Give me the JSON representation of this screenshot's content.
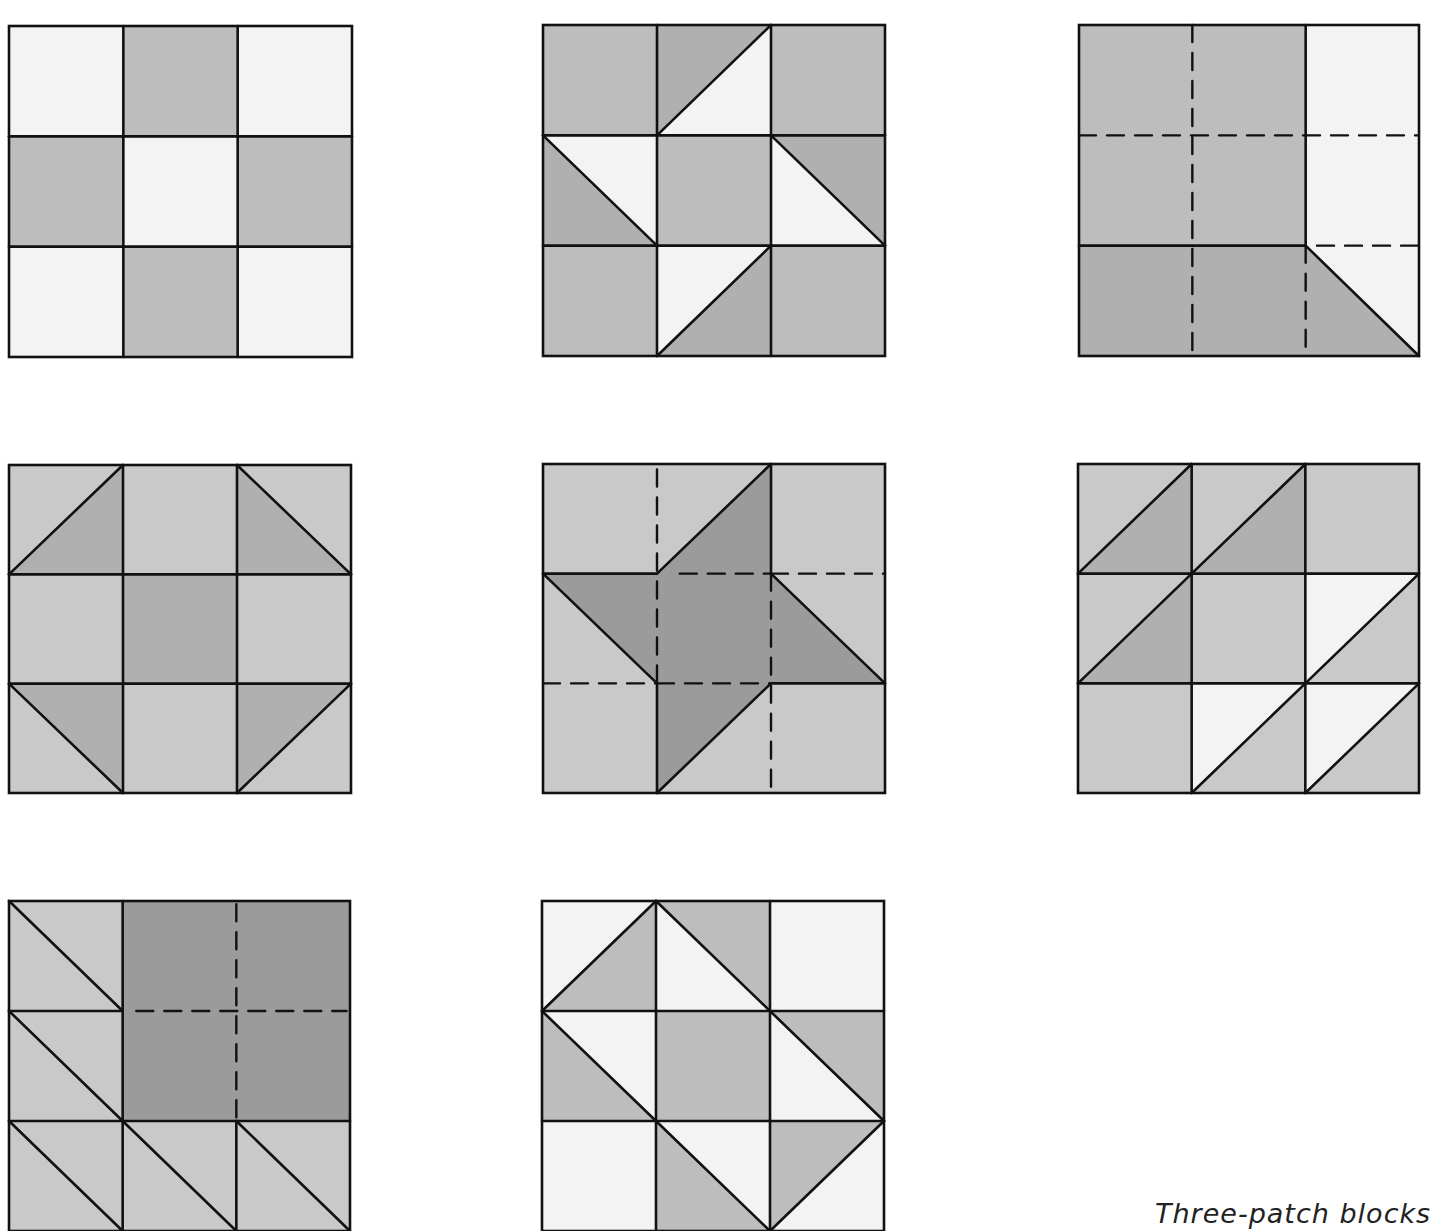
{
  "page": {
    "caption": "Three-patch blocks"
  },
  "colors": {
    "white": "#f3f3f3",
    "light": "#c9c9c9",
    "medium": "#bdbdbd",
    "mid_dark": "#b0b0b0",
    "dark": "#9b9b9b",
    "line": "#111111"
  },
  "blocks": [
    {
      "id": "block-1",
      "x": 9,
      "y": 26,
      "w": 343,
      "h": 331,
      "shapes": [
        {
          "t": "rect",
          "x": 0,
          "y": 0,
          "w": 1,
          "h": 1,
          "c": "white"
        },
        {
          "t": "rect",
          "x": 1,
          "y": 0,
          "w": 1,
          "h": 1,
          "c": "medium"
        },
        {
          "t": "rect",
          "x": 2,
          "y": 0,
          "w": 1,
          "h": 1,
          "c": "white"
        },
        {
          "t": "rect",
          "x": 0,
          "y": 1,
          "w": 1,
          "h": 1,
          "c": "medium"
        },
        {
          "t": "rect",
          "x": 1,
          "y": 1,
          "w": 1,
          "h": 1,
          "c": "white"
        },
        {
          "t": "rect",
          "x": 2,
          "y": 1,
          "w": 1,
          "h": 1,
          "c": "medium"
        },
        {
          "t": "rect",
          "x": 0,
          "y": 2,
          "w": 1,
          "h": 1,
          "c": "white"
        },
        {
          "t": "rect",
          "x": 1,
          "y": 2,
          "w": 1,
          "h": 1,
          "c": "medium"
        },
        {
          "t": "rect",
          "x": 2,
          "y": 2,
          "w": 1,
          "h": 1,
          "c": "white"
        }
      ],
      "lines": [
        [
          1,
          0,
          1,
          3
        ],
        [
          2,
          0,
          2,
          3
        ],
        [
          0,
          1,
          3,
          1
        ],
        [
          0,
          2,
          3,
          2
        ]
      ],
      "dashes": []
    },
    {
      "id": "block-2",
      "x": 543,
      "y": 25,
      "w": 342,
      "h": 331,
      "shapes": [
        {
          "t": "rect",
          "x": 0,
          "y": 0,
          "w": 3,
          "h": 3,
          "c": "medium"
        },
        {
          "t": "poly",
          "p": [
            [
              1,
              0
            ],
            [
              2,
              0
            ],
            [
              1,
              1
            ]
          ],
          "c": "mid_dark"
        },
        {
          "t": "poly",
          "p": [
            [
              2,
              0
            ],
            [
              2,
              1
            ],
            [
              1,
              1
            ]
          ],
          "c": "white"
        },
        {
          "t": "poly",
          "p": [
            [
              0,
              1
            ],
            [
              1,
              1
            ],
            [
              1,
              2
            ]
          ],
          "c": "white"
        },
        {
          "t": "poly",
          "p": [
            [
              0,
              1
            ],
            [
              1,
              2
            ],
            [
              0,
              2
            ]
          ],
          "c": "mid_dark"
        },
        {
          "t": "poly",
          "p": [
            [
              2,
              1
            ],
            [
              3,
              1
            ],
            [
              3,
              2
            ]
          ],
          "c": "mid_dark"
        },
        {
          "t": "poly",
          "p": [
            [
              2,
              1
            ],
            [
              3,
              2
            ],
            [
              2,
              2
            ]
          ],
          "c": "white"
        },
        {
          "t": "poly",
          "p": [
            [
              1,
              2
            ],
            [
              2,
              2
            ],
            [
              1,
              3
            ]
          ],
          "c": "white"
        },
        {
          "t": "poly",
          "p": [
            [
              2,
              2
            ],
            [
              2,
              3
            ],
            [
              1,
              3
            ]
          ],
          "c": "mid_dark"
        }
      ],
      "lines": [
        [
          1,
          0,
          1,
          3
        ],
        [
          2,
          0,
          2,
          3
        ],
        [
          0,
          1,
          3,
          1
        ],
        [
          0,
          2,
          3,
          2
        ],
        [
          1,
          1,
          2,
          0
        ],
        [
          0,
          1,
          1,
          2
        ],
        [
          2,
          1,
          3,
          2
        ],
        [
          1,
          3,
          2,
          2
        ]
      ],
      "dashes": []
    },
    {
      "id": "block-3",
      "x": 1079,
      "y": 25,
      "w": 340,
      "h": 331,
      "shapes": [
        {
          "t": "rect",
          "x": 0,
          "y": 0,
          "w": 2,
          "h": 2,
          "c": "medium"
        },
        {
          "t": "rect",
          "x": 2,
          "y": 0,
          "w": 1,
          "h": 3,
          "c": "white"
        },
        {
          "t": "poly",
          "p": [
            [
              0,
              2
            ],
            [
              2,
              2
            ],
            [
              3,
              3
            ],
            [
              0,
              3
            ]
          ],
          "c": "mid_dark"
        }
      ],
      "lines": [
        [
          2,
          0,
          2,
          2
        ],
        [
          0,
          2,
          2,
          2
        ],
        [
          2,
          2,
          3,
          3
        ]
      ],
      "dashes": [
        [
          1,
          0,
          1,
          3
        ],
        [
          0,
          1,
          3,
          1
        ],
        [
          2.1,
          2,
          3,
          2
        ],
        [
          2,
          2,
          2,
          3
        ]
      ]
    },
    {
      "id": "block-4",
      "x": 9,
      "y": 465,
      "w": 342,
      "h": 328,
      "shapes": [
        {
          "t": "rect",
          "x": 0,
          "y": 0,
          "w": 3,
          "h": 3,
          "c": "light"
        },
        {
          "t": "rect",
          "x": 1,
          "y": 1,
          "w": 1,
          "h": 1,
          "c": "mid_dark"
        },
        {
          "t": "poly",
          "p": [
            [
              0,
              1
            ],
            [
              1,
              0
            ],
            [
              1,
              1
            ]
          ],
          "c": "mid_dark"
        },
        {
          "t": "poly",
          "p": [
            [
              2,
              0
            ],
            [
              3,
              1
            ],
            [
              2,
              1
            ]
          ],
          "c": "mid_dark"
        },
        {
          "t": "poly",
          "p": [
            [
              0,
              2
            ],
            [
              1,
              2
            ],
            [
              1,
              3
            ]
          ],
          "c": "mid_dark"
        },
        {
          "t": "poly",
          "p": [
            [
              2,
              2
            ],
            [
              3,
              2
            ],
            [
              2,
              3
            ]
          ],
          "c": "mid_dark"
        }
      ],
      "lines": [
        [
          1,
          0,
          1,
          3
        ],
        [
          2,
          0,
          2,
          3
        ],
        [
          0,
          1,
          3,
          1
        ],
        [
          0,
          2,
          3,
          2
        ],
        [
          0,
          1,
          1,
          0
        ],
        [
          2,
          0,
          3,
          1
        ],
        [
          0,
          2,
          1,
          3
        ],
        [
          3,
          2,
          2,
          3
        ]
      ],
      "dashes": []
    },
    {
      "id": "block-5",
      "x": 543,
      "y": 464,
      "w": 342,
      "h": 329,
      "shapes": [
        {
          "t": "rect",
          "x": 0,
          "y": 0,
          "w": 3,
          "h": 3,
          "c": "light"
        },
        {
          "t": "poly",
          "p": [
            [
              1,
              1
            ],
            [
              2,
              0
            ],
            [
              2,
              1
            ],
            [
              3,
              2
            ],
            [
              2,
              2
            ],
            [
              1,
              3
            ],
            [
              1,
              2
            ],
            [
              0,
              1
            ]
          ],
          "c": "dark"
        }
      ],
      "lines": [
        [
          1,
          1,
          2,
          0
        ],
        [
          2,
          0,
          2,
          1
        ],
        [
          2,
          1,
          3,
          2
        ],
        [
          0,
          1,
          1,
          1
        ],
        [
          0,
          1,
          1,
          2
        ],
        [
          1,
          2,
          1,
          3
        ],
        [
          1,
          3,
          2,
          2
        ],
        [
          2,
          2,
          3,
          2
        ]
      ],
      "dashes": [
        [
          1,
          0.05,
          1,
          2
        ],
        [
          1.2,
          1,
          2,
          1
        ],
        [
          2,
          1,
          3,
          1
        ],
        [
          0,
          2,
          1,
          2
        ],
        [
          1,
          2,
          2,
          2
        ],
        [
          2,
          1,
          2,
          2.95
        ]
      ]
    },
    {
      "id": "block-6",
      "x": 1078,
      "y": 464,
      "w": 341,
      "h": 329,
      "shapes": [
        {
          "t": "rect",
          "x": 0,
          "y": 0,
          "w": 3,
          "h": 3,
          "c": "light"
        },
        {
          "t": "poly",
          "p": [
            [
              0,
              1
            ],
            [
              1,
              0
            ],
            [
              1,
              1
            ]
          ],
          "c": "mid_dark"
        },
        {
          "t": "poly",
          "p": [
            [
              1,
              1
            ],
            [
              2,
              0
            ],
            [
              2,
              1
            ]
          ],
          "c": "mid_dark"
        },
        {
          "t": "poly",
          "p": [
            [
              0,
              2
            ],
            [
              1,
              1
            ],
            [
              1,
              2
            ]
          ],
          "c": "mid_dark"
        },
        {
          "t": "poly",
          "p": [
            [
              2,
              1
            ],
            [
              3,
              1
            ],
            [
              2,
              2
            ]
          ],
          "c": "white"
        },
        {
          "t": "poly",
          "p": [
            [
              1,
              2
            ],
            [
              2,
              2
            ],
            [
              1,
              3
            ]
          ],
          "c": "white"
        },
        {
          "t": "poly",
          "p": [
            [
              2,
              2
            ],
            [
              3,
              2
            ],
            [
              2,
              3
            ]
          ],
          "c": "white"
        }
      ],
      "lines": [
        [
          1,
          0,
          1,
          3
        ],
        [
          2,
          0,
          2,
          3
        ],
        [
          0,
          1,
          3,
          1
        ],
        [
          0,
          2,
          3,
          2
        ],
        [
          0,
          1,
          1,
          0
        ],
        [
          1,
          1,
          2,
          0
        ],
        [
          0,
          2,
          1,
          1
        ],
        [
          2,
          2,
          3,
          1
        ],
        [
          1,
          3,
          2,
          2
        ],
        [
          2,
          3,
          3,
          2
        ]
      ],
      "dashes": []
    },
    {
      "id": "block-7",
      "x": 9,
      "y": 901,
      "w": 341,
      "h": 330,
      "shapes": [
        {
          "t": "rect",
          "x": 0,
          "y": 0,
          "w": 3,
          "h": 3,
          "c": "light"
        },
        {
          "t": "rect",
          "x": 1,
          "y": 0,
          "w": 2,
          "h": 2,
          "c": "dark"
        }
      ],
      "lines": [
        [
          1,
          0,
          1,
          3
        ],
        [
          2,
          2,
          2,
          3
        ],
        [
          0,
          1,
          1,
          1
        ],
        [
          0,
          2,
          3,
          2
        ],
        [
          0,
          0,
          1,
          1
        ],
        [
          0,
          1,
          1,
          2
        ],
        [
          0,
          2,
          1,
          3
        ],
        [
          1,
          2,
          2,
          3
        ],
        [
          2,
          2,
          3,
          3
        ]
      ],
      "dashes": [
        [
          2,
          0.03,
          2,
          1.97
        ],
        [
          1.12,
          1,
          2.97,
          1
        ]
      ]
    },
    {
      "id": "block-8",
      "x": 542,
      "y": 901,
      "w": 342,
      "h": 330,
      "shapes": [
        {
          "t": "rect",
          "x": 0,
          "y": 0,
          "w": 3,
          "h": 3,
          "c": "white"
        },
        {
          "t": "rect",
          "x": 1,
          "y": 1,
          "w": 1,
          "h": 1,
          "c": "medium"
        },
        {
          "t": "poly",
          "p": [
            [
              0,
              1
            ],
            [
              1,
              0
            ],
            [
              1,
              1
            ]
          ],
          "c": "medium"
        },
        {
          "t": "poly",
          "p": [
            [
              1,
              0
            ],
            [
              2,
              0
            ],
            [
              2,
              1
            ]
          ],
          "c": "medium"
        },
        {
          "t": "poly",
          "p": [
            [
              0,
              1
            ],
            [
              1,
              2
            ],
            [
              0,
              2
            ]
          ],
          "c": "medium"
        },
        {
          "t": "poly",
          "p": [
            [
              2,
              1
            ],
            [
              3,
              1
            ],
            [
              3,
              2
            ]
          ],
          "c": "medium"
        },
        {
          "t": "poly",
          "p": [
            [
              1,
              2
            ],
            [
              2,
              3
            ],
            [
              1,
              3
            ]
          ],
          "c": "medium"
        },
        {
          "t": "poly",
          "p": [
            [
              2,
              2
            ],
            [
              3,
              2
            ],
            [
              2,
              3
            ]
          ],
          "c": "medium"
        }
      ],
      "lines": [
        [
          1,
          0,
          1,
          3
        ],
        [
          2,
          0,
          2,
          3
        ],
        [
          0,
          1,
          3,
          1
        ],
        [
          0,
          2,
          3,
          2
        ],
        [
          0,
          1,
          1,
          0
        ],
        [
          1,
          0,
          2,
          1
        ],
        [
          0,
          1,
          1,
          2
        ],
        [
          2,
          1,
          3,
          2
        ],
        [
          1,
          2,
          2,
          3
        ],
        [
          3,
          2,
          2,
          3
        ]
      ],
      "dashes": []
    }
  ]
}
